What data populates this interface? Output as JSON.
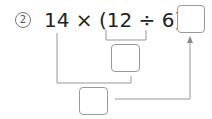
{
  "problem": {
    "number_label": "2",
    "expression": "14 × (12 ÷ 6) =",
    "parts": {
      "a": "14",
      "times": "×",
      "open": "(",
      "b": "12",
      "div": "÷",
      "c": "6",
      "close": ")",
      "eq": "="
    },
    "answer_box": "",
    "intermediate_box": "",
    "bottom_box": ""
  },
  "colors": {
    "text": "#222222",
    "lines": "#999999"
  }
}
